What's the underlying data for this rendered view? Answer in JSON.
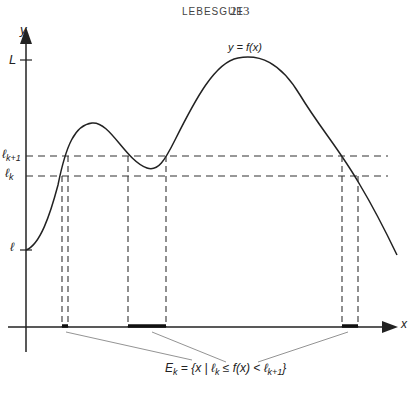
{
  "header": {
    "running_head": "LEBESGUE",
    "page_number": "213"
  },
  "axes": {
    "y_label": "y",
    "x_label": "x",
    "y_ticks": [
      {
        "label": "L",
        "position": "upper bound"
      },
      {
        "label": "ℓ_{k+1}",
        "position": "upper level"
      },
      {
        "label": "ℓ_k",
        "position": "lower level"
      },
      {
        "label": "ℓ",
        "position": "lower bound"
      }
    ]
  },
  "labels": {
    "L": "L",
    "l_k1_base": "ℓ",
    "l_k1_sub": "k+1",
    "l_k_base": "ℓ",
    "l_k_sub": "k",
    "l": "ℓ",
    "curve": "y = f(x)",
    "set_E": "E",
    "set_E_sub": "k",
    "set_def_1": " = {x | ℓ",
    "set_def_sub1": "k",
    "set_def_2": " ≤ f(x) < ℓ",
    "set_def_sub2": "k+1",
    "set_def_3": "}"
  },
  "diagram": {
    "highlighted_intervals": 3,
    "line_color": "#222222",
    "guide_color": "#888888"
  }
}
